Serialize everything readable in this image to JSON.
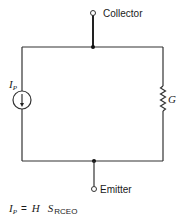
{
  "diagram": {
    "type": "equivalent-circuit",
    "terminals": {
      "collector": "Collector",
      "emitter": "Emitter"
    },
    "current_source": {
      "symbol": "I",
      "subscript": "P",
      "direction": "down"
    },
    "conductance": {
      "symbol": "G"
    },
    "equation": {
      "lhs_symbol": "I",
      "lhs_subscript": "P",
      "equals": "=",
      "factor1": "H",
      "factor2_symbol": "S",
      "factor2_subscript": "RCEO"
    }
  }
}
